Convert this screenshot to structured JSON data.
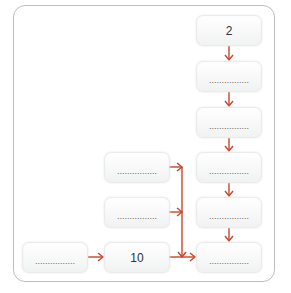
{
  "diagram": {
    "arrow_color": "#c8452c",
    "blank_text": "................",
    "right_column": [
      {
        "id": "r1",
        "text": "2"
      },
      {
        "id": "r2",
        "text": ""
      },
      {
        "id": "r3",
        "text": ""
      },
      {
        "id": "r4",
        "text": ""
      },
      {
        "id": "r5",
        "text": ""
      },
      {
        "id": "r6",
        "text": ""
      }
    ],
    "middle_column": [
      {
        "id": "m1",
        "text": ""
      },
      {
        "id": "m2",
        "text": ""
      },
      {
        "id": "m3",
        "text": "10"
      }
    ],
    "left_column": [
      {
        "id": "l1",
        "text": ""
      }
    ]
  }
}
